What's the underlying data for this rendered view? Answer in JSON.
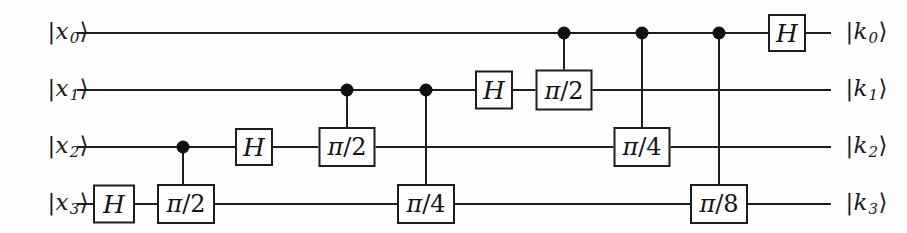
{
  "figure": {
    "type": "quantum-circuit",
    "background_color": "#fefefe",
    "line_color": "#1d1d1d",
    "gate_fill_color": "#ffffff",
    "num_qubits": 4
  },
  "input_labels": [
    {
      "name": "input-label-x0",
      "text": "|x0⟩",
      "base": "|x",
      "sub": "0",
      "close": "⟩",
      "x": 47,
      "y": 33
    },
    {
      "name": "input-label-x1",
      "text": "|x1⟩",
      "base": "|x",
      "sub": "1",
      "close": "⟩",
      "x": 47,
      "y": 90
    },
    {
      "name": "input-label-x2",
      "text": "|x2⟩",
      "base": "|x",
      "sub": "2",
      "close": "⟩",
      "x": 47,
      "y": 147
    },
    {
      "name": "input-label-x3",
      "text": "|x3⟩",
      "base": "|x",
      "sub": "3",
      "close": "⟩",
      "x": 47,
      "y": 204
    }
  ],
  "output_labels": [
    {
      "name": "output-label-k0",
      "text": "|k0⟩",
      "base": "|k",
      "sub": "0",
      "close": "⟩",
      "x": 845,
      "y": 33
    },
    {
      "name": "output-label-k1",
      "text": "|k1⟩",
      "base": "|k",
      "sub": "1",
      "close": "⟩",
      "x": 845,
      "y": 90
    },
    {
      "name": "output-label-k2",
      "text": "|k2⟩",
      "base": "|k",
      "sub": "2",
      "close": "⟩",
      "x": 845,
      "y": 147
    },
    {
      "name": "output-label-k3",
      "text": "|k3⟩",
      "base": "|k",
      "sub": "3",
      "close": "⟩",
      "x": 845,
      "y": 204
    }
  ],
  "wires": [
    {
      "name": "qubit-wire-0",
      "index": 0,
      "y": 33,
      "x1": 77,
      "x2": 831
    },
    {
      "name": "qubit-wire-1",
      "index": 1,
      "y": 90,
      "x1": 77,
      "x2": 831
    },
    {
      "name": "qubit-wire-2",
      "index": 2,
      "y": 147,
      "x1": 77,
      "x2": 831
    },
    {
      "name": "qubit-wire-3",
      "index": 3,
      "y": 204,
      "x1": 77,
      "x2": 831
    }
  ],
  "gates": [
    {
      "name": "gate-h-q3",
      "label": "H",
      "kind": "hadamard",
      "qubit": 3,
      "cx": 114,
      "cy": 204,
      "w": 42,
      "h": 39
    },
    {
      "name": "gate-phase-pi2-q3",
      "label": "π/2",
      "pi": "π",
      "denom": "/2",
      "kind": "phase",
      "qubit": 3,
      "cx": 186,
      "cy": 204,
      "w": 58,
      "h": 40
    },
    {
      "name": "gate-h-q2",
      "label": "H",
      "kind": "hadamard",
      "qubit": 2,
      "cx": 254,
      "cy": 147,
      "w": 38,
      "h": 38
    },
    {
      "name": "gate-phase-pi2-q2",
      "label": "π/2",
      "pi": "π",
      "denom": "/2",
      "kind": "phase",
      "qubit": 2,
      "cx": 347,
      "cy": 147,
      "w": 57,
      "h": 40
    },
    {
      "name": "gate-phase-pi4-q3",
      "label": "π/4",
      "pi": "π",
      "denom": "/4",
      "kind": "phase",
      "qubit": 3,
      "cx": 426,
      "cy": 204,
      "w": 58,
      "h": 40
    },
    {
      "name": "gate-h-q1",
      "label": "H",
      "kind": "hadamard",
      "qubit": 1,
      "cx": 494,
      "cy": 90,
      "w": 38,
      "h": 39
    },
    {
      "name": "gate-phase-pi2-q1",
      "label": "π/2",
      "pi": "π",
      "denom": "/2",
      "kind": "phase",
      "qubit": 1,
      "cx": 564,
      "cy": 90,
      "w": 57,
      "h": 41
    },
    {
      "name": "gate-phase-pi4-q2",
      "label": "π/4",
      "pi": "π",
      "denom": "/4",
      "kind": "phase",
      "qubit": 2,
      "cx": 642,
      "cy": 147,
      "w": 57,
      "h": 40
    },
    {
      "name": "gate-phase-pi8-q3",
      "label": "π/8",
      "pi": "π",
      "denom": "/8",
      "kind": "phase",
      "qubit": 3,
      "cx": 719,
      "cy": 204,
      "w": 58,
      "h": 40
    },
    {
      "name": "gate-h-q0",
      "label": "H",
      "kind": "hadamard",
      "qubit": 0,
      "cx": 787,
      "cy": 33,
      "w": 38,
      "h": 38
    }
  ],
  "controls": [
    {
      "name": "control-dot-q2-to-q3",
      "control_qubit": 2,
      "target_qubit": 3,
      "cx": 183,
      "cy": 147,
      "line_y1": 147,
      "line_y2": 204
    },
    {
      "name": "control-dot-q1-to-q2",
      "control_qubit": 1,
      "target_qubit": 2,
      "cx": 347,
      "cy": 90,
      "line_y1": 90,
      "line_y2": 147
    },
    {
      "name": "control-dot-q1-to-q3",
      "control_qubit": 1,
      "target_qubit": 3,
      "cx": 426,
      "cy": 90,
      "line_y1": 90,
      "line_y2": 204
    },
    {
      "name": "control-dot-q0-to-q1",
      "control_qubit": 0,
      "target_qubit": 1,
      "cx": 564,
      "cy": 33,
      "line_y1": 33,
      "line_y2": 90
    },
    {
      "name": "control-dot-q0-to-q2",
      "control_qubit": 0,
      "target_qubit": 2,
      "cx": 642,
      "cy": 33,
      "line_y1": 33,
      "line_y2": 147
    },
    {
      "name": "control-dot-q0-to-q3",
      "control_qubit": 0,
      "target_qubit": 3,
      "cx": 719,
      "cy": 33,
      "line_y1": 33,
      "line_y2": 204
    }
  ]
}
